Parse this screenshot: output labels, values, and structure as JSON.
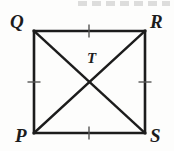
{
  "figure": {
    "type": "geometry-diagram",
    "shape_name": "square",
    "background_color": "#fdfdfc",
    "stroke_color": "#1c1c1c",
    "tick_color": "#555555",
    "label_color": "#1c1c1c",
    "width": 174,
    "height": 151,
    "vertices": [
      {
        "id": "Q",
        "label": "Q",
        "x": 34,
        "y": 31,
        "corner": "top-left"
      },
      {
        "id": "R",
        "label": "R",
        "x": 145,
        "y": 31,
        "corner": "top-right"
      },
      {
        "id": "S",
        "label": "S",
        "x": 145,
        "y": 133,
        "corner": "bottom-right"
      },
      {
        "id": "P",
        "label": "P",
        "x": 34,
        "y": 133,
        "corner": "bottom-left"
      }
    ],
    "interior_points": [
      {
        "id": "T",
        "label": "T",
        "x": 89,
        "y": 82,
        "description": "intersection-of-diagonals"
      }
    ],
    "sides": [
      {
        "id": "QR",
        "from": "Q",
        "to": "R",
        "ticks": 1
      },
      {
        "id": "RS",
        "from": "R",
        "to": "S",
        "ticks": 1
      },
      {
        "id": "SP",
        "from": "S",
        "to": "P",
        "ticks": 1
      },
      {
        "id": "PQ",
        "from": "P",
        "to": "Q",
        "ticks": 1
      }
    ],
    "diagonals": [
      {
        "id": "QS",
        "from": "Q",
        "to": "S"
      },
      {
        "id": "PR",
        "from": "P",
        "to": "R"
      }
    ],
    "tick_marks": [
      {
        "id": "tick-QR",
        "side": "QR",
        "x": 89,
        "y": 31,
        "orientation": "vertical"
      },
      {
        "id": "tick-RS",
        "side": "RS",
        "x": 145,
        "y": 82,
        "orientation": "horizontal"
      },
      {
        "id": "tick-SP",
        "side": "SP",
        "x": 89,
        "y": 133,
        "orientation": "vertical"
      },
      {
        "id": "tick-PQ",
        "side": "PQ",
        "x": 34,
        "y": 82,
        "orientation": "horizontal"
      }
    ],
    "stroke_width": 2.6,
    "tick_stroke_width": 1.4,
    "tick_length": 13
  }
}
